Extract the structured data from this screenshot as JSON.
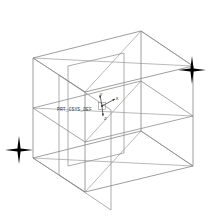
{
  "view": {
    "background_color": "#ffffff",
    "line_color": "#808080",
    "edge_color": "#6e6e6e",
    "marker_color": "#000000",
    "text_color": "#3a3a3a"
  },
  "model": {
    "csys_name": "PRT_CSYS_DEF",
    "axes": {
      "y_label": "Y",
      "x_label": "X",
      "z_label": "Z"
    }
  },
  "datum_points": [
    {
      "name": "datum-point-right",
      "x": 192,
      "y": 70
    },
    {
      "name": "datum-point-left",
      "x": 19,
      "y": 150
    }
  ],
  "geometry": {
    "outer_box": {
      "front_top_left": [
        33,
        58
      ],
      "front_top_right": [
        141,
        31
      ],
      "back_top_right": [
        193,
        66
      ],
      "back_top_left": [
        85,
        92
      ],
      "front_bottom_left": [
        33,
        158
      ],
      "front_bottom_right": [
        141,
        131
      ],
      "back_bottom_right": [
        193,
        166
      ],
      "back_bottom_left": [
        85,
        192
      ]
    },
    "inner_panel": {
      "top_left": [
        68,
        66
      ],
      "top_right": [
        124,
        53
      ],
      "bottom_right": [
        124,
        153
      ],
      "bottom_left": [
        68,
        166
      ]
    },
    "mid_plane": {
      "left": [
        33,
        108
      ],
      "right": [
        193,
        116
      ]
    }
  }
}
